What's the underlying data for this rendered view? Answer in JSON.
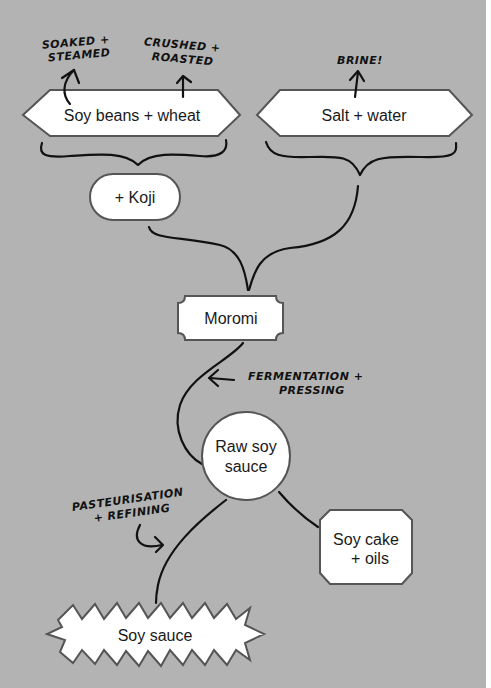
{
  "diagram": {
    "colors": {
      "background": "#b3b3b3",
      "node_fill": "#ffffff",
      "node_stroke": "#555555",
      "line": "#111111"
    },
    "nodes": {
      "soy_beans_wheat": {
        "label": "Soy beans + wheat",
        "shape": "hexagon"
      },
      "salt_water": {
        "label": "Salt + water",
        "shape": "hexagon"
      },
      "koji": {
        "label": "+ Koji",
        "shape": "pill"
      },
      "moromi": {
        "label": "Moromi",
        "shape": "notched-rectangle"
      },
      "raw_soy_sauce": {
        "label_line1": "Raw soy",
        "label_line2": "sauce",
        "shape": "circle"
      },
      "soy_cake_oils": {
        "label_line1": "Soy cake",
        "label_line2": "+ oils",
        "shape": "octagon"
      },
      "soy_sauce": {
        "label": "Soy sauce",
        "shape": "starburst"
      }
    },
    "annotations": {
      "soaked_steamed": {
        "line1": "SOAKED +",
        "line2": "STEAMED"
      },
      "crushed_roasted": {
        "line1": "CRUSHED +",
        "line2": "ROASTED"
      },
      "brine": {
        "line1": "BRINE!"
      },
      "fermentation_pressing": {
        "line1": "FERMENTATION +",
        "line2": "PRESSING"
      },
      "pasteurisation_refining": {
        "line1": "PASTEURISATION",
        "line2": "+ REFINING"
      }
    }
  }
}
